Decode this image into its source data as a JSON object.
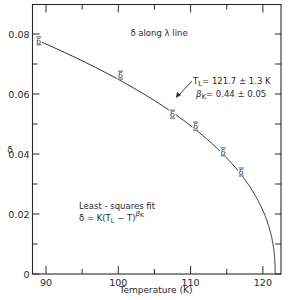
{
  "chart_data": {
    "type": "line",
    "title": "δ along λ line",
    "xlabel": "Temperature (K)",
    "ylabel": "δ",
    "xlim": [
      88,
      123
    ],
    "ylim": [
      0,
      0.09
    ],
    "grid": false,
    "legend": null,
    "x_ticks": [
      90,
      100,
      110,
      120
    ],
    "x_tick_labels": [
      "90",
      "100",
      "110",
      "120"
    ],
    "x_minor_ticks": [
      95,
      105,
      115
    ],
    "y_ticks": [
      0,
      0.02,
      0.04,
      0.06,
      0.08
    ],
    "y_tick_labels": [
      "0",
      "0.02",
      "0.04",
      "0.06",
      "0.08"
    ],
    "y_minor_ticks": [
      0.01,
      0.03,
      0.05,
      0.07
    ],
    "series": [
      {
        "name": "measured δ",
        "marker": "δ",
        "x": [
          89.0,
          100.3,
          107.5,
          110.7,
          114.5,
          117.0
        ],
        "y": [
          0.0777,
          0.0663,
          0.0533,
          0.0493,
          0.0407,
          0.034
        ]
      },
      {
        "name": "least-squares fit",
        "style": "line",
        "formula": "δ = K(T_L − T)^β_K",
        "params": {
          "T_L": 121.7,
          "T_L_err": 1.3,
          "beta_K": 0.44,
          "beta_K_err": 0.05
        }
      }
    ],
    "annotations": [
      {
        "text": "δ along λ line",
        "position": "top-center"
      },
      {
        "text": "T_L = 121.7 ± 1.3 K",
        "position": "right-of-curve",
        "arrow": true
      },
      {
        "text": "β_K = 0.44 ± 0.05",
        "position": "right-of-curve"
      },
      {
        "text": "Least-squares fit",
        "position": "lower-left"
      },
      {
        "text": "δ = K(T_L − T)^β_K",
        "position": "lower-left"
      }
    ]
  },
  "labels": {
    "title": "δ along λ line",
    "xlabel": "Temperature (K)",
    "ylabel": "δ",
    "tl_prefix": "T",
    "tl_sub": "L",
    "tl_value": "= 121.7 ± 1.3 K",
    "bk_prefix": "β",
    "bk_sub": "K",
    "bk_value": "= 0.44 ± 0.05",
    "fit_line1": "Least - squares  fit",
    "fit_line2_a": "δ = K(T",
    "fit_line2_sub": "L",
    "fit_line2_b": " − T)",
    "fit_line2_sup": "β",
    "fit_line2_supsub": "K",
    "marker_glyph": "δ"
  },
  "colors": {
    "ink": "#2a2a2a",
    "background": "#ffffff"
  }
}
